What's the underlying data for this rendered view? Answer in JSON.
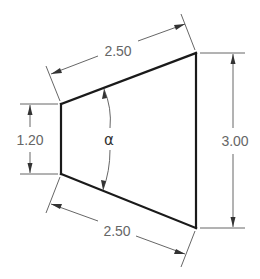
{
  "drawing": {
    "type": "dimensioned trapezoid",
    "colors": {
      "outline": "#1a1a1a",
      "dimension_lines": "#555555",
      "dimension_text": "#666666"
    },
    "dimensions": {
      "top_side": "2.50",
      "bottom_side": "2.50",
      "left_height": "1.20",
      "right_height": "3.00",
      "angle_symbol": "α"
    }
  }
}
